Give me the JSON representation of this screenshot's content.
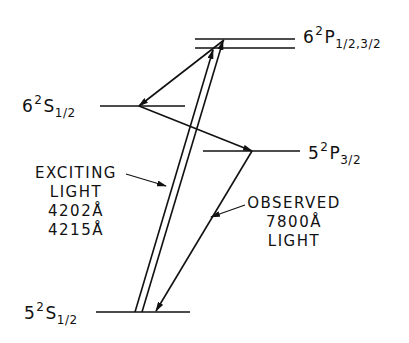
{
  "levels": {
    "p6": {
      "n": "6",
      "mult": "2",
      "L": "P",
      "j": "1/2,3/2"
    },
    "s6": {
      "n": "6",
      "mult": "2",
      "L": "S",
      "j": "1/2"
    },
    "p5": {
      "n": "5",
      "mult": "2",
      "L": "P",
      "j": "3/2"
    },
    "s5": {
      "n": "5",
      "mult": "2",
      "L": "S",
      "j": "1/2"
    }
  },
  "exciting": {
    "line1": "EXCITING",
    "line2": "LIGHT",
    "line3": "4202Å",
    "line4": "4215Å"
  },
  "observed": {
    "line1": "OBSERVED",
    "line2": "7800Å",
    "line3": "LIGHT"
  }
}
